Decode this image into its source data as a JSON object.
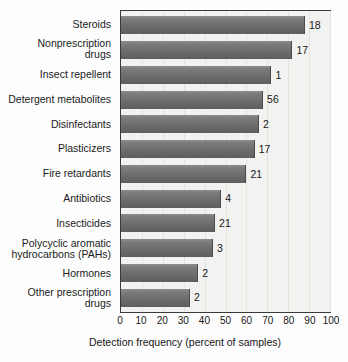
{
  "chart_data": {
    "type": "bar",
    "orientation": "horizontal",
    "title": "",
    "xlabel": "Detection frequency (percent of samples)",
    "ylabel": "",
    "xlim": [
      0,
      100
    ],
    "xticks": [
      0,
      10,
      20,
      30,
      40,
      50,
      60,
      70,
      80,
      90,
      100
    ],
    "grid": true,
    "legend": "none",
    "categories": [
      "Steroids",
      "Nonprescription drugs",
      "Insect repellent",
      "Detergent metabolites",
      "Disinfectants",
      "Plasticizers",
      "Fire retardants",
      "Antibiotics",
      "Insecticides",
      "Polycyclic aromatic hydrocarbons (PAHs)",
      "Hormones",
      "Other prescription drugs"
    ],
    "values": [
      88,
      82,
      72,
      68,
      66,
      64,
      60,
      48,
      45,
      44,
      37,
      33
    ],
    "point_labels": [
      "18",
      "17",
      "1",
      "56",
      "2",
      "17",
      "21",
      "4",
      "21",
      "3",
      "2",
      "2"
    ],
    "point_label_meaning": "number of compounds in class"
  },
  "bars": [
    {
      "label_line1": "Steroids",
      "label_line2": "",
      "value": 88,
      "annotation": "18"
    },
    {
      "label_line1": "Nonprescription",
      "label_line2": "drugs",
      "value": 82,
      "annotation": "17"
    },
    {
      "label_line1": "Insect repellent",
      "label_line2": "",
      "value": 72,
      "annotation": "1"
    },
    {
      "label_line1": "Detergent metabolites",
      "label_line2": "",
      "value": 68,
      "annotation": "56"
    },
    {
      "label_line1": "Disinfectants",
      "label_line2": "",
      "value": 66,
      "annotation": "2"
    },
    {
      "label_line1": "Plasticizers",
      "label_line2": "",
      "value": 64,
      "annotation": "17"
    },
    {
      "label_line1": "Fire retardants",
      "label_line2": "",
      "value": 60,
      "annotation": "21"
    },
    {
      "label_line1": "Antibiotics",
      "label_line2": "",
      "value": 48,
      "annotation": "4"
    },
    {
      "label_line1": "Insecticides",
      "label_line2": "",
      "value": 45,
      "annotation": "21"
    },
    {
      "label_line1": "Polycyclic aromatic",
      "label_line2": "hydrocarbons (PAHs)",
      "value": 44,
      "annotation": "3"
    },
    {
      "label_line1": "Hormones",
      "label_line2": "",
      "value": 37,
      "annotation": "2"
    },
    {
      "label_line1": "Other prescription",
      "label_line2": "drugs",
      "value": 33,
      "annotation": "2"
    }
  ],
  "axis": {
    "title": "Detection frequency (percent of samples)",
    "ticks": [
      "0",
      "10",
      "20",
      "30",
      "40",
      "50",
      "60",
      "70",
      "80",
      "90",
      "100"
    ]
  },
  "colors": {
    "bar_light": "#8c8c8c",
    "bar_dark": "#5e5e5e",
    "plot_background": "#f2f2f0",
    "gridline": "#e3e3e0",
    "frame": "#3a3a3a",
    "text": "#161616",
    "page_background": "#fdfdfd"
  }
}
